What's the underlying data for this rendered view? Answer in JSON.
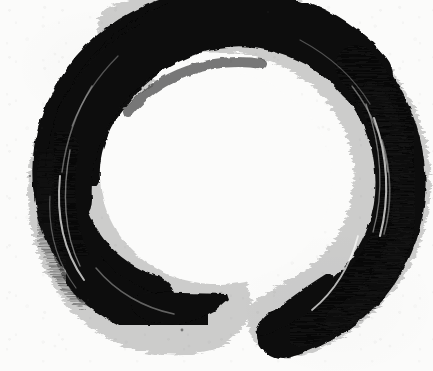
{
  "artwork": {
    "title": "Ensō",
    "subject": "zen-circle-brush-painting",
    "medium": "sumi ink on paper",
    "alt_text": "A hand-painted black ink circle with a thick brush stroke, open at the bottom, on off-white paper",
    "canvas": {
      "width": 433,
      "height": 371
    },
    "colors": {
      "paper": "#fbfbfa",
      "ink": "#0a0a0a",
      "ink_soft": "#141414",
      "ink_fringe": "#1c1c1c"
    },
    "geometry": {
      "center_x": 212,
      "center_y": 176,
      "outer_radius_x": 193,
      "outer_radius_y": 172,
      "inner_radius_x": 118,
      "inner_radius_y": 108,
      "stroke_start_angle_deg": 118,
      "stroke_end_angle_deg": 72,
      "gap_left_x": 228,
      "gap_right_x": 258,
      "gap_y": 310,
      "max_stroke_width": 62,
      "min_stroke_width": 14
    },
    "features": {
      "tail_left": "blunt-wedge-terminus",
      "tail_right": "tapered-point-terminus",
      "texture": "dry-brush-streaks",
      "opening": "bottom-center"
    }
  }
}
